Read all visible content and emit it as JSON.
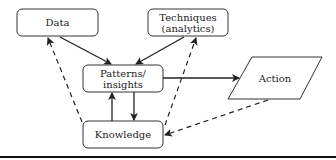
{
  "diagram": {
    "nodes": {
      "data": {
        "label": "Data"
      },
      "techniques": {
        "label_line1": "Techniques",
        "label_line2": "(analytics)"
      },
      "patterns": {
        "label_line1": "Patterns/",
        "label_line2": "insights"
      },
      "knowledge": {
        "label": "Knowledge"
      },
      "action": {
        "label": "Action"
      }
    },
    "edges": [
      {
        "from": "Data",
        "to": "Patterns/insights",
        "style": "solid"
      },
      {
        "from": "Techniques (analytics)",
        "to": "Patterns/insights",
        "style": "solid"
      },
      {
        "from": "Patterns/insights",
        "to": "Action",
        "style": "solid"
      },
      {
        "from": "Patterns/insights",
        "to": "Knowledge",
        "style": "solid"
      },
      {
        "from": "Knowledge",
        "to": "Patterns/insights",
        "style": "solid"
      },
      {
        "from": "Knowledge",
        "to": "Data",
        "style": "dashed"
      },
      {
        "from": "Knowledge",
        "to": "Techniques (analytics)",
        "style": "dashed"
      },
      {
        "from": "Action",
        "to": "Knowledge",
        "style": "dashed"
      }
    ],
    "colors": {
      "stroke": "#222222",
      "background": "#ffffff"
    }
  }
}
